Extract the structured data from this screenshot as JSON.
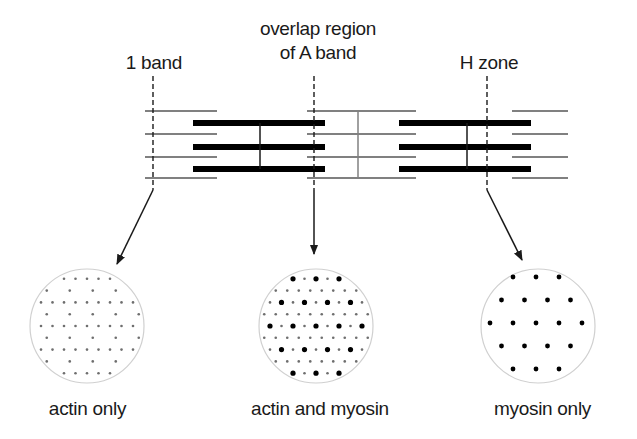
{
  "diagram": {
    "title_labels": {
      "i_band": "1 band",
      "overlap_line1": "overlap region",
      "overlap_line2": "of A band",
      "h_zone": "H zone"
    },
    "cross_section_labels": {
      "left": "actin only",
      "middle": "actin and myosin",
      "right": "myosin only"
    },
    "colors": {
      "thick_filament": "#000000",
      "thin_filament": "#808080",
      "z_line": "#808080",
      "m_line": "#1a1a1a",
      "dashed_marker": "#1a1a1a",
      "arrow": "#1a1a1a",
      "circle_outline": "#d0d0d0",
      "actin_dot": "#6e6e6e",
      "myosin_dot": "#000000"
    },
    "structure": {
      "thin_rows_y": [
        111,
        134,
        157,
        178
      ],
      "thick_rows_y": [
        123,
        147,
        169
      ],
      "thin_segments": [
        [
          145,
          217
        ],
        [
          307,
          416
        ],
        [
          512,
          568
        ]
      ],
      "thick_segments": [
        [
          193,
          325
        ],
        [
          399,
          531
        ]
      ],
      "z_line_x": 358,
      "m_lines_x": [
        260,
        467
      ],
      "markers": [
        {
          "name": "i-band-marker",
          "x": 153
        },
        {
          "name": "overlap-marker",
          "x": 314
        },
        {
          "name": "h-zone-marker",
          "x": 487
        }
      ]
    },
    "cross_sections": [
      {
        "name": "actin-only",
        "cx": 87,
        "cy": 326,
        "r": 57,
        "actin": true,
        "myosin": false
      },
      {
        "name": "actin-and-myosin",
        "cx": 316,
        "cy": 326,
        "r": 57,
        "actin": true,
        "myosin": true
      },
      {
        "name": "myosin-only",
        "cx": 538,
        "cy": 326,
        "r": 57,
        "actin": false,
        "myosin": true
      }
    ]
  }
}
